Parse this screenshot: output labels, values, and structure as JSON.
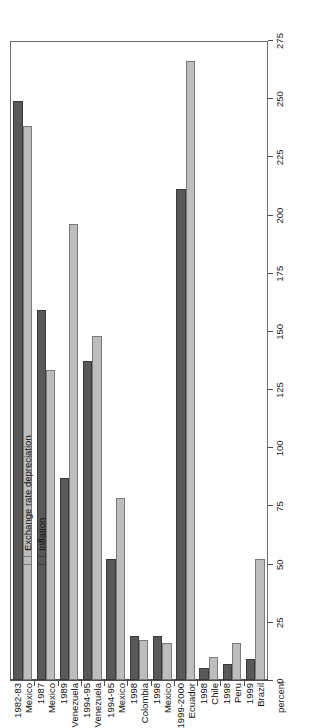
{
  "chart_data": {
    "type": "bar",
    "title": "",
    "xlabel": "percent",
    "ylabel": "",
    "orientation": "horizontal",
    "grid": false,
    "legend_position": "top-left",
    "axis_title": "percent",
    "xlim": [
      0,
      275
    ],
    "tick_labels": [
      "0",
      "25",
      "50",
      "75",
      "100",
      "125",
      "150",
      "175",
      "200",
      "225",
      "250",
      "275"
    ],
    "tick_values": [
      0,
      25,
      50,
      75,
      100,
      125,
      150,
      175,
      200,
      225,
      250,
      275
    ],
    "categories": [
      {
        "period": "1982-83",
        "country": "Mexico"
      },
      {
        "period": "1987",
        "country": "Mexico"
      },
      {
        "period": "1989",
        "country": "Venezuela"
      },
      {
        "period": "1994-95",
        "country": "Venezuela"
      },
      {
        "period": "1994-95",
        "country": "Mexico"
      },
      {
        "period": "1998",
        "country": "Colombia"
      },
      {
        "period": "1998",
        "country": "Mexico"
      },
      {
        "period": "1999-2000",
        "country": "Ecuador"
      },
      {
        "period": "1998",
        "country": "Chile"
      },
      {
        "period": "1998",
        "country": "Peru"
      },
      {
        "period": "1999",
        "country": "Brazil"
      }
    ],
    "series": [
      {
        "name": "Exchange rate depreciation",
        "color": "#bdbdbd",
        "values": [
          238,
          133,
          196,
          148,
          78,
          17,
          16,
          266,
          10,
          16,
          52
        ]
      },
      {
        "name": "Inflation",
        "color": "#595959",
        "values": [
          249,
          159,
          87,
          137,
          52,
          19,
          19,
          211,
          5,
          7,
          9
        ]
      }
    ]
  },
  "legend": {
    "items": [
      {
        "label": "Exchange rate depreciation",
        "swatch": "light"
      },
      {
        "label": "Inflation",
        "swatch": "dark"
      }
    ]
  }
}
